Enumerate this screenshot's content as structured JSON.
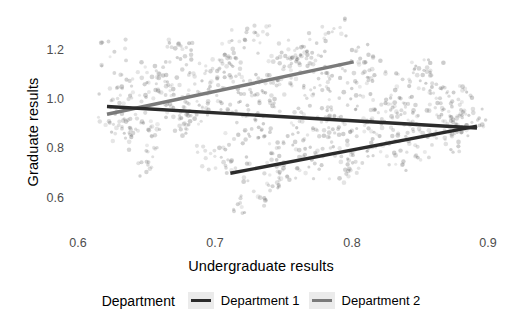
{
  "chart_data": {
    "type": "scatter",
    "title": "",
    "xlabel": "Undergraduate results",
    "ylabel": "Graduate results",
    "xlim": [
      0.57,
      0.93
    ],
    "ylim": [
      0.52,
      1.27
    ],
    "xticks": [
      0.6,
      0.7,
      0.8,
      0.9
    ],
    "xtick_labels": [
      "0.6",
      "0.7",
      "0.8",
      "0.9"
    ],
    "yticks": [
      0.6,
      0.8,
      1.0,
      1.2
    ],
    "ytick_labels": [
      "0.6",
      "0.8",
      "1.0",
      "1.2"
    ],
    "grid": false,
    "legend_position": "bottom",
    "legend_title": "Department",
    "series": [
      {
        "name": "Department 1",
        "color": "#2b2b2b",
        "fit_line": {
          "x": [
            0.6,
            0.9
          ],
          "y": [
            0.952,
            0.878
          ]
        },
        "points_x": [
          0.603,
          0.612,
          0.618,
          0.625,
          0.631,
          0.638,
          0.644,
          0.651,
          0.657,
          0.664,
          0.671,
          0.677,
          0.684,
          0.69,
          0.697,
          0.703,
          0.71,
          0.716,
          0.723,
          0.73,
          0.736,
          0.743,
          0.749,
          0.756,
          0.762,
          0.769,
          0.776,
          0.782,
          0.789,
          0.795,
          0.802,
          0.808,
          0.815,
          0.821,
          0.828,
          0.835,
          0.841,
          0.848,
          0.854,
          0.861,
          0.867,
          0.874,
          0.881,
          0.887,
          0.894,
          0.606,
          0.628,
          0.66,
          0.688,
          0.712,
          0.74,
          0.765,
          0.79,
          0.812,
          0.838,
          0.862,
          0.885,
          0.614,
          0.642,
          0.673,
          0.702,
          0.728,
          0.754,
          0.778,
          0.805,
          0.83,
          0.856,
          0.878
        ],
        "points_y": [
          0.95,
          1.02,
          0.88,
          1.07,
          0.93,
          0.81,
          1.0,
          0.96,
          1.12,
          0.86,
          0.91,
          1.04,
          0.79,
          0.97,
          1.09,
          0.84,
          0.92,
          1.01,
          0.88,
          1.06,
          0.95,
          0.83,
          1.03,
          0.9,
          0.98,
          1.11,
          0.87,
          0.94,
          1.05,
          0.82,
          0.99,
          0.91,
          1.08,
          0.85,
          0.96,
          1.02,
          0.89,
          0.93,
          1.04,
          0.87,
          0.98,
          0.9,
          1.0,
          0.94,
          0.88,
          1.14,
          0.76,
          1.16,
          0.74,
          1.18,
          0.72,
          1.1,
          0.78,
          1.13,
          0.8,
          1.07,
          0.83,
          0.86,
          1.05,
          0.97,
          1.09,
          0.85,
          1.12,
          0.9,
          1.02,
          0.94,
          1.06,
          0.92
        ]
      },
      {
        "name": "Department 2",
        "color": "#7a7a7a",
        "fit_line_low": {
          "x": [
            0.6,
            0.8
          ],
          "y": [
            0.925,
            1.105
          ]
        },
        "fit_line_high": {
          "x": [
            0.7,
            0.9
          ],
          "y": [
            0.722,
            0.884
          ]
        },
        "points_x": [
          0.607,
          0.621,
          0.634,
          0.648,
          0.662,
          0.675,
          0.689,
          0.702,
          0.716,
          0.73,
          0.743,
          0.757,
          0.77,
          0.784,
          0.798,
          0.705,
          0.719,
          0.733,
          0.746,
          0.76,
          0.774,
          0.788,
          0.801,
          0.815,
          0.829,
          0.842,
          0.856,
          0.87,
          0.883,
          0.897,
          0.61,
          0.64,
          0.668,
          0.695,
          0.723,
          0.75,
          0.778,
          0.708,
          0.738,
          0.766,
          0.794,
          0.822,
          0.85,
          0.878
        ],
        "points_y": [
          0.93,
          1.0,
          0.87,
          1.06,
          0.95,
          1.1,
          0.99,
          1.15,
          1.04,
          1.2,
          1.08,
          1.13,
          1.17,
          1.22,
          1.11,
          0.73,
          0.66,
          0.79,
          0.71,
          0.84,
          0.75,
          0.88,
          0.8,
          0.91,
          0.83,
          0.95,
          0.86,
          0.98,
          0.89,
          0.93,
          0.9,
          1.03,
          0.92,
          1.07,
          0.97,
          1.12,
          1.02,
          0.62,
          0.69,
          0.77,
          0.72,
          0.82,
          0.78,
          0.87
        ]
      }
    ]
  },
  "legend": {
    "title": "Department",
    "entries": [
      {
        "label": "Department 1",
        "color": "#2b2b2b"
      },
      {
        "label": "Department 2",
        "color": "#7a7a7a"
      }
    ]
  },
  "axes": {
    "y_title": "Graduate results",
    "x_title": "Undergraduate results",
    "y_ticks": [
      "1.2",
      "1.0",
      "0.8",
      "0.6"
    ],
    "x_ticks": [
      "0.6",
      "0.7",
      "0.8",
      "0.9"
    ]
  }
}
